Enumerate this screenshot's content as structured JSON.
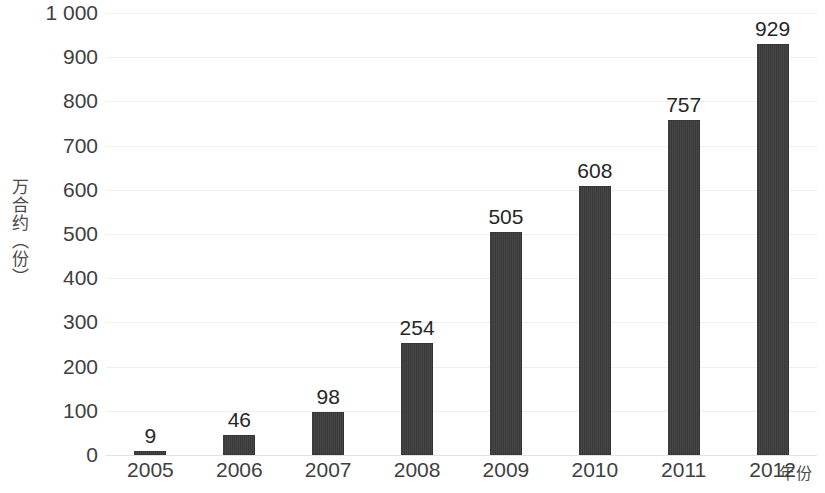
{
  "chart_data": {
    "type": "bar",
    "title": "",
    "xlabel": "年份",
    "ylabel": "万合约（份）",
    "categories": [
      "2005",
      "2006",
      "2007",
      "2008",
      "2009",
      "2010",
      "2011",
      "2012"
    ],
    "values": [
      9,
      46,
      98,
      254,
      505,
      608,
      757,
      929
    ],
    "data_labels": [
      "9",
      "46",
      "98",
      "254",
      "505",
      "608",
      "757",
      "929"
    ],
    "ylim": [
      0,
      1000
    ],
    "ytick_values": [
      0,
      100,
      200,
      300,
      400,
      500,
      600,
      700,
      800,
      900,
      1000
    ],
    "ytick_labels": [
      "0",
      "100",
      "200",
      "300",
      "400",
      "500",
      "600",
      "700",
      "800",
      "900",
      "1 000"
    ],
    "grid": true,
    "legend": null,
    "legend_position": "none",
    "series": [
      {
        "name": "万合约（份）",
        "values": [
          9,
          46,
          98,
          254,
          505,
          608,
          757,
          929
        ]
      }
    ],
    "colors": {
      "bar": "#3c3c3c",
      "gridline": "#efefef",
      "baseline": "#e2e2e2",
      "text": "#3f3f3f",
      "background": "#ffffff"
    }
  }
}
